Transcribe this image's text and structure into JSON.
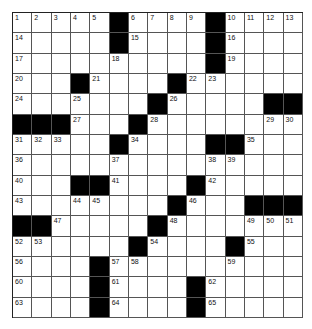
{
  "puzzle": {
    "rows": 15,
    "cols": 15,
    "grid": [
      "1,2,3,4,5,#,6,7,8,9,#,10,11,12,13",
      "14,.,.,.,.,#,15,.,.,.,#,16,.,.,.",
      "17,.,.,.,.,18,.,.,.,.,#,19,.,.,.",
      "20,.,.,#,21,.,.,.,#,22,23,.,.,.,.",
      "24,.,.,25,.,.,.,#,26,.,.,.,.,#,#",
      "#,#,#,27,.,.,#,28,.,.,.,.,.,29,30",
      "31,32,33,.,.,#,34,.,.,.,#,#,35,.,.",
      "36,.,.,.,.,37,.,.,.,.,38,39,.,.,.",
      "40,.,.,#,#,41,.,.,.,#,42,.,.,.,.",
      "43,.,.,44,45,.,.,.,#,46,.,.,#,#,#",
      "#,#,47,.,.,.,.,#,48,.,.,.,49,50,51",
      "52,53,.,.,.,.,#,54,.,.,.,#,55,.,.",
      "56,.,.,.,#,57,58,.,.,.,.,59,.,.,.",
      "60,.,.,.,#,61,.,.,.,#,62,.,.,.,.",
      "63,.,.,.,#,64,.,.,.,#,65,.,.,.,."
    ]
  }
}
